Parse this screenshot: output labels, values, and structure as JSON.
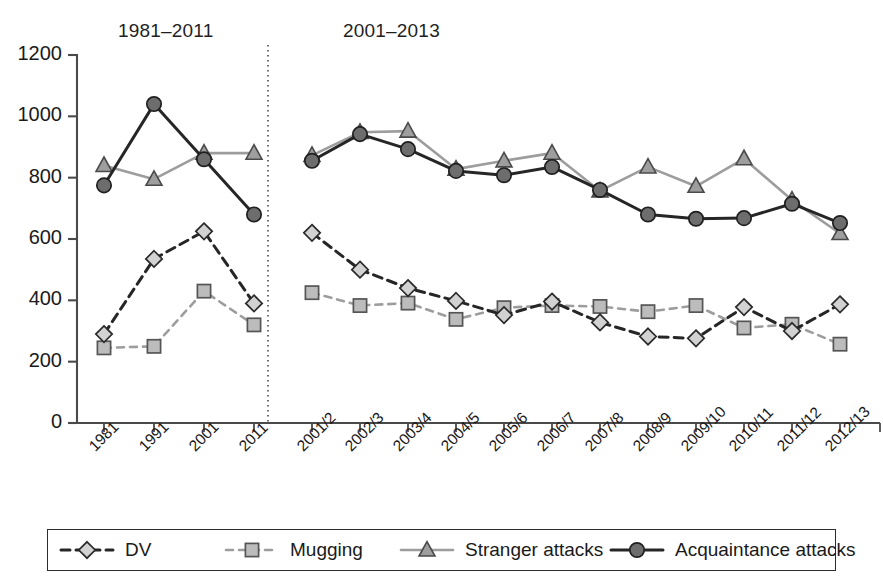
{
  "panels": {
    "left_title": "1981–2011",
    "right_title": "2001–2013"
  },
  "axis": {
    "y_ticks": [
      "1200",
      "1000",
      "800",
      "600",
      "400",
      "200",
      "0"
    ],
    "y_min": 0,
    "y_max": 1200,
    "y_step": 200,
    "grid": false
  },
  "legend": {
    "position": "bottom",
    "items": [
      {
        "label": "DV",
        "symbol": "diamond",
        "dash": "long-dash",
        "color": "#262626",
        "marker_fill": "#d0d0d0"
      },
      {
        "label": "Mugging",
        "symbol": "square",
        "dash": "short-dash",
        "color": "#9a9a9a",
        "marker_fill": "#b8b8b8"
      },
      {
        "label": "Stranger attacks",
        "symbol": "triangle",
        "dash": "solid",
        "color": "#9a9a9a",
        "marker_fill": "#9e9e9e"
      },
      {
        "label": "Acquaintance attacks",
        "symbol": "circle",
        "dash": "solid",
        "color": "#262626",
        "marker_fill": "#6b6b6b"
      }
    ]
  },
  "chart_data": {
    "type": "line",
    "title": "",
    "xlabel": "",
    "ylabel": "",
    "ylim": [
      0,
      1200
    ],
    "y_step": 200,
    "grid": false,
    "legend_position": "bottom",
    "panels": [
      {
        "name": "1981–2011",
        "categories": [
          "1981",
          "1991",
          "2001",
          "2011"
        ],
        "series": [
          {
            "name": "DV",
            "values": [
              290,
              535,
              625,
              390
            ]
          },
          {
            "name": "Mugging",
            "values": [
              245,
              250,
              430,
              320
            ]
          },
          {
            "name": "Stranger attacks",
            "values": [
              840,
              795,
              880,
              880
            ]
          },
          {
            "name": "Acquaintance attacks",
            "values": [
              775,
              1040,
              860,
              680
            ]
          }
        ]
      },
      {
        "name": "2001–2013",
        "categories": [
          "2001/2",
          "2002/3",
          "2003/4",
          "2004/5",
          "2005/6",
          "2006/7",
          "2007/8",
          "2008/9",
          "2009/10",
          "2010/11",
          "2011/12",
          "2012/13"
        ],
        "series": [
          {
            "name": "DV",
            "values": [
              620,
              500,
              440,
              398,
              352,
              396,
              328,
              282,
              276,
              378,
              300,
              387
            ]
          },
          {
            "name": "Mugging",
            "values": [
              425,
              383,
              391,
              338,
              376,
              383,
              380,
              363,
              383,
              310,
              322,
              257
            ]
          },
          {
            "name": "Stranger attacks",
            "values": [
              873,
              948,
              952,
              828,
              855,
              880,
              757,
              835,
              772,
              862,
              727,
              618
            ]
          },
          {
            "name": "Acquaintance attacks",
            "values": [
              855,
              942,
              893,
              822,
              808,
              835,
              760,
              680,
              666,
              668,
              715,
              652
            ]
          }
        ]
      }
    ]
  },
  "colors": {
    "axis": "#4a4a4a",
    "dark_line": "#262626",
    "light_line": "#9a9a9a",
    "divider": "#555555",
    "background": "#ffffff"
  }
}
